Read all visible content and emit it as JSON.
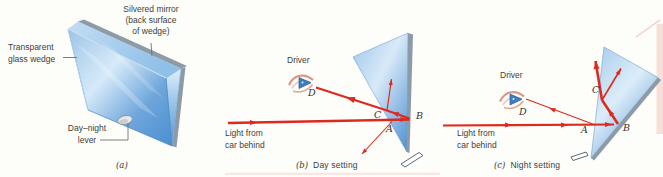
{
  "figure": {
    "panel_a": {
      "caption": "(a)",
      "silvered_label_line1": "Silvered mirror",
      "silvered_label_line2": "(back surface",
      "silvered_label_line3": "of wedge)",
      "transparent_label_line1": "Transparent",
      "transparent_label_line2": "glass wedge",
      "lever_label_line1": "Day–night",
      "lever_label_line2": "lever"
    },
    "panel_b": {
      "caption_letter": "(b)",
      "caption_text": "Day setting",
      "light_label_line1": "Light from",
      "light_label_line2": "car behind",
      "driver_label": "Driver",
      "point_a": "A",
      "point_b": "B",
      "point_c": "C",
      "point_d": "D"
    },
    "panel_c": {
      "caption_letter": "(c)",
      "caption_text": "Night setting",
      "light_label_line1": "Light from",
      "light_label_line2": "car behind",
      "driver_label": "Driver",
      "point_a": "A",
      "point_b": "B",
      "point_c": "C",
      "point_d": "D"
    },
    "colors": {
      "ray_red": "#df291e",
      "glass_blue": "#6ea9dd",
      "glass_light": "#d8eaf8",
      "silver_gray": "#8d9ba7",
      "eye_skin": "#e09c8a",
      "pupil_blue": "#3c7ec2"
    },
    "icons": [
      "driver-eye-icon",
      "lever-knob-icon",
      "mirror-pivot-icon"
    ]
  }
}
